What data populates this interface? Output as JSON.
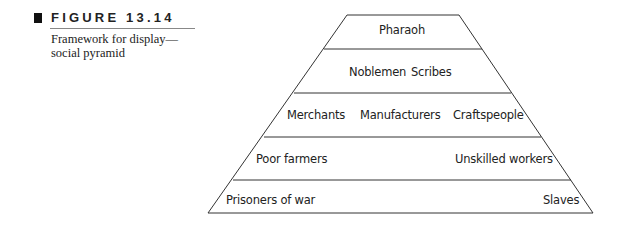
{
  "caption": {
    "figure_label": "FIGURE 13.14",
    "description": "Framework for display— social pyramid"
  },
  "pyramid": {
    "tiers": [
      {
        "name": "top",
        "labels": [
          "Pharaoh"
        ]
      },
      {
        "name": "second",
        "labels": [
          "Noblemen",
          "Scribes"
        ]
      },
      {
        "name": "third",
        "labels": [
          "Merchants",
          "Manufacturers",
          "Craftspeople"
        ]
      },
      {
        "name": "fourth",
        "labels": [
          "Poor farmers",
          "Unskilled workers"
        ]
      },
      {
        "name": "bottom",
        "labels": [
          "Prisoners of war",
          "Slaves"
        ]
      }
    ],
    "line_color": "#333333"
  }
}
